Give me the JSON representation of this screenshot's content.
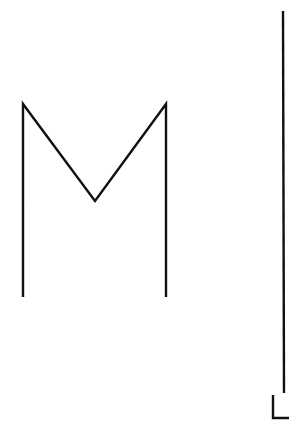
{
  "canvas": {
    "width": 299,
    "height": 438,
    "background": "#ffffff"
  },
  "stroke": {
    "color": "#111111",
    "width": 2.4
  },
  "shapes": {
    "m_shape": {
      "points": "23,297 23,104 95,201 166,104 166,297"
    },
    "long_line": {
      "x1": 283,
      "y1": 11,
      "x2": 284,
      "y2": 393
    },
    "l_shape": {
      "points": "273,395 273,418 289,418"
    }
  }
}
